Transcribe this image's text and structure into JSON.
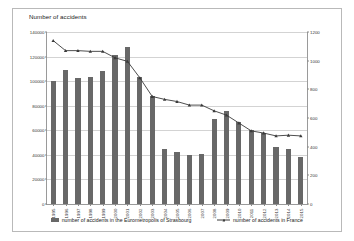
{
  "chart_data": {
    "type": "bar",
    "title": "Number of accidents",
    "xlabel": "",
    "ylabel": "Number of accidents",
    "ylabel_right": "",
    "grid": true,
    "legend_position": "bottom",
    "categories": [
      "1995",
      "1996",
      "1997",
      "1998",
      "1999",
      "2000",
      "2001",
      "2002",
      "2003",
      "2004",
      "2005",
      "2006",
      "2007",
      "2008",
      "2009",
      "2010",
      "2011",
      "2012",
      "2013",
      "2014",
      "2015"
    ],
    "ylim": [
      0,
      140000
    ],
    "yticks": [
      "0",
      "20000",
      "40000",
      "60000",
      "80000",
      "100000",
      "120000",
      "140000"
    ],
    "ylim_right": [
      0,
      1200
    ],
    "yticks_right": [
      "0",
      "200",
      "400",
      "600",
      "800",
      "1000",
      "1200"
    ],
    "series": [
      {
        "name": "number of accidents in the Eurometropolis of Strasbourg",
        "type": "bar",
        "axis": "left",
        "color": "#686868",
        "values": [
          100000,
          109000,
          102500,
          103000,
          108500,
          121000,
          128000,
          103000,
          88000,
          45000,
          42500,
          39500,
          40500,
          69000,
          76000,
          67000,
          60000,
          57500,
          46500,
          45000,
          38000
        ]
      },
      {
        "name": "number of accidents in France",
        "type": "line",
        "axis": "right",
        "color": "#3a3a3a",
        "values": [
          1140,
          1070,
          1070,
          1065,
          1065,
          1020,
          995,
          880,
          750,
          730,
          715,
          690,
          690,
          650,
          620,
          565,
          510,
          495,
          475,
          480,
          475
        ]
      }
    ]
  },
  "legend": {
    "items": [
      {
        "label": "number of accidents in the Eurometropolis of Strasbourg",
        "marker": "bar-swatch-icon"
      },
      {
        "label": "number of accidents in France",
        "marker": "line-marker-icon"
      }
    ]
  }
}
